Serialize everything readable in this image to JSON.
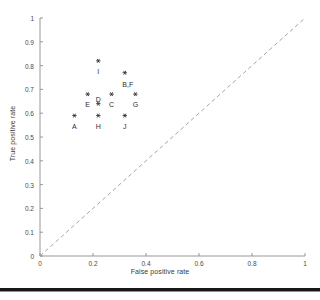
{
  "chart_data": {
    "type": "scatter",
    "title": "",
    "xlabel": "False positive rate",
    "ylabel": "True positive rate",
    "xlim": [
      0,
      1
    ],
    "ylim": [
      0,
      1
    ],
    "xticks": [
      "0",
      "0.2",
      "0.4",
      "0.6",
      "0.8",
      "1"
    ],
    "xtick_values": [
      0,
      0.2,
      0.4,
      0.6,
      0.8,
      1
    ],
    "yticks": [
      "0",
      "0.1",
      "0.2",
      "0.3",
      "0.4",
      "0.5",
      "0.6",
      "0.7",
      "0.8",
      "0.9",
      "1"
    ],
    "ytick_values": [
      0,
      0.1,
      0.2,
      0.3,
      0.4,
      0.5,
      0.6,
      0.7,
      0.8,
      0.9,
      1
    ],
    "grid": false,
    "legend": "none",
    "marker": "asterisk",
    "marker_color": "#333333",
    "reference_line": {
      "name": "chance-diagonal",
      "style": "dashed",
      "color": "#9a9a9a",
      "from": [
        0,
        0
      ],
      "to": [
        1,
        1
      ]
    },
    "points": [
      {
        "label": "A",
        "x": 0.13,
        "y": 0.59,
        "label_dx": 0,
        "label_dy": 11
      },
      {
        "label": "B,F",
        "x": 0.32,
        "y": 0.77,
        "label_dx": 3,
        "label_dy": 12
      },
      {
        "label": "C",
        "x": 0.27,
        "y": 0.68,
        "label_dx": 0,
        "label_dy": 11
      },
      {
        "label": "D",
        "x": 0.22,
        "y": 0.64,
        "label_dx": 0,
        "label_dy": -4
      },
      {
        "label": "E",
        "x": 0.18,
        "y": 0.68,
        "label_dx": 0,
        "label_dy": 11
      },
      {
        "label": "G",
        "x": 0.36,
        "y": 0.68,
        "label_dx": 0,
        "label_dy": 11
      },
      {
        "label": "H",
        "x": 0.22,
        "y": 0.59,
        "label_dx": 0,
        "label_dy": 11
      },
      {
        "label": "I",
        "x": 0.22,
        "y": 0.82,
        "label_dx": 0,
        "label_dy": 11
      },
      {
        "label": "J",
        "x": 0.32,
        "y": 0.59,
        "label_dx": 0,
        "label_dy": 11
      }
    ]
  },
  "figure": {
    "axis_color": "#8d8d8d",
    "background": "#ffffff"
  }
}
